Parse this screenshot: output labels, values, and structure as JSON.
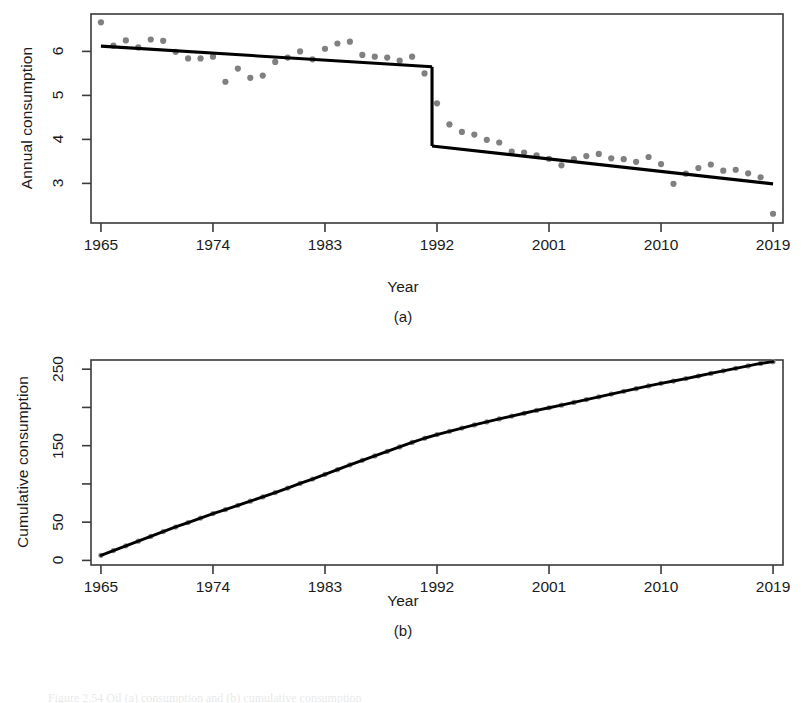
{
  "figure": {
    "caption_partial": "Figure 2.54   Oil (a) consumption and (b) cumulative consumption",
    "panels": [
      {
        "letter": "(a)"
      },
      {
        "letter": "(b)"
      }
    ]
  },
  "chart_data": [
    {
      "type": "scatter",
      "panel": "a",
      "title": "",
      "xlabel": "Year",
      "ylabel": "Annual consumption",
      "xlim": [
        1964.2,
        2019.8
      ],
      "ylim": [
        2.1,
        6.85
      ],
      "xticks": [
        1965,
        1974,
        1983,
        1992,
        2001,
        2010,
        2019
      ],
      "xtick_labels": [
        "1965",
        "1974",
        "1983",
        "1992",
        "2001",
        "2010",
        "2019"
      ],
      "yticks": [
        3,
        4,
        5,
        6
      ],
      "ytick_labels": [
        "3",
        "4",
        "5",
        "6"
      ],
      "grid": false,
      "legend": "none",
      "point_color": "#808080",
      "line_color": "#000000",
      "x": [
        1965,
        1966,
        1967,
        1968,
        1969,
        1970,
        1971,
        1972,
        1973,
        1974,
        1975,
        1976,
        1977,
        1978,
        1979,
        1980,
        1981,
        1982,
        1983,
        1984,
        1985,
        1986,
        1987,
        1988,
        1989,
        1990,
        1991,
        1992,
        1993,
        1994,
        1995,
        1996,
        1997,
        1998,
        1999,
        2000,
        2001,
        2002,
        2003,
        2004,
        2005,
        2006,
        2007,
        2008,
        2009,
        2010,
        2011,
        2012,
        2013,
        2014,
        2015,
        2016,
        2017,
        2018,
        2019
      ],
      "y": [
        6.66,
        6.13,
        6.25,
        6.09,
        6.27,
        6.24,
        5.99,
        5.84,
        5.84,
        5.88,
        5.31,
        5.61,
        5.4,
        5.45,
        5.76,
        5.86,
        6.0,
        5.82,
        6.06,
        6.18,
        6.22,
        5.92,
        5.88,
        5.86,
        5.79,
        5.88,
        5.5,
        4.82,
        4.34,
        4.17,
        4.11,
        3.99,
        3.93,
        3.72,
        3.7,
        3.64,
        3.56,
        3.41,
        3.55,
        3.62,
        3.67,
        3.57,
        3.55,
        3.49,
        3.6,
        3.44,
        2.99,
        3.22,
        3.35,
        3.43,
        3.29,
        3.31,
        3.23,
        3.14,
        2.31
      ],
      "fit_segments": [
        {
          "name": "segment-1",
          "x": [
            1965,
            1991.6
          ],
          "y": [
            6.12,
            5.65
          ]
        },
        {
          "name": "segment-2",
          "x": [
            1991.6,
            2019
          ],
          "y": [
            3.85,
            2.99
          ]
        }
      ],
      "breakpoint_year": 1991.6
    },
    {
      "type": "line",
      "panel": "b",
      "title": "",
      "xlabel": "Year",
      "ylabel": "Cumulative consumption",
      "xlim": [
        1964.2,
        2019.8
      ],
      "ylim": [
        -6,
        262
      ],
      "xticks": [
        1965,
        1974,
        1983,
        1992,
        2001,
        2010,
        2019
      ],
      "xtick_labels": [
        "1965",
        "1974",
        "1983",
        "1992",
        "2001",
        "2010",
        "2019"
      ],
      "yticks": [
        0,
        50,
        100,
        150,
        200,
        250
      ],
      "ytick_labels": [
        "0",
        "50",
        "",
        "150",
        "",
        "250"
      ],
      "grid": false,
      "legend": "none",
      "point_color": "#8c8c8c",
      "line_color": "#000000",
      "x": [
        1965,
        1966,
        1967,
        1968,
        1969,
        1970,
        1971,
        1972,
        1973,
        1974,
        1975,
        1976,
        1977,
        1978,
        1979,
        1980,
        1981,
        1982,
        1983,
        1984,
        1985,
        1986,
        1987,
        1988,
        1989,
        1990,
        1991,
        1992,
        1993,
        1994,
        1995,
        1996,
        1997,
        1998,
        1999,
        2000,
        2001,
        2002,
        2003,
        2004,
        2005,
        2006,
        2007,
        2008,
        2009,
        2010,
        2011,
        2012,
        2013,
        2014,
        2015,
        2016,
        2017,
        2018,
        2019
      ],
      "y": [
        6.7,
        12.8,
        19.1,
        25.2,
        31.4,
        37.7,
        43.7,
        49.5,
        55.3,
        61.2,
        66.5,
        72.1,
        77.5,
        83.0,
        88.7,
        94.6,
        100.6,
        106.4,
        112.5,
        118.6,
        124.9,
        130.8,
        136.6,
        142.5,
        148.3,
        154.2,
        159.7,
        164.5,
        168.8,
        173.0,
        177.1,
        181.1,
        185.0,
        188.7,
        192.4,
        196.1,
        199.6,
        203.0,
        206.6,
        210.2,
        213.9,
        217.4,
        221.0,
        224.5,
        228.1,
        231.5,
        234.5,
        237.7,
        241.1,
        244.5,
        247.8,
        251.1,
        254.3,
        257.5,
        259.8
      ]
    }
  ]
}
